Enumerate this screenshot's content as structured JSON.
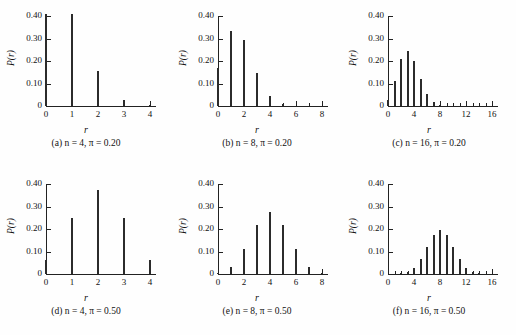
{
  "figure": {
    "ylabel": "P(r)",
    "xlabel": "r",
    "y_ticks": [
      "0",
      "0.10",
      "0.20",
      "0.30",
      "0.40"
    ],
    "y_tick_values": [
      0,
      0.1,
      0.2,
      0.3,
      0.4
    ],
    "ylim": [
      0,
      0.4
    ],
    "background": "#fefefe",
    "bar_color": "#2b2b2b",
    "axis_color": "#222222"
  },
  "chart_data": [
    {
      "type": "bar",
      "panel": "a",
      "caption": "(a) n = 4, π = 0.20",
      "n": 4,
      "pi": 0.2,
      "title": "",
      "xlabel": "r",
      "ylabel": "P(r)",
      "xlim": [
        0,
        4
      ],
      "ylim": [
        0,
        0.4
      ],
      "x_tick_labels": [
        "0",
        "1",
        "2",
        "3",
        "4"
      ],
      "x_tick_values": [
        0,
        1,
        2,
        3,
        4
      ],
      "x_minor_ticks": [],
      "grid": false,
      "legend": "none",
      "categories": [
        0,
        1,
        2,
        3,
        4
      ],
      "values": [
        0.4096,
        0.4096,
        0.1536,
        0.0256,
        0.0016
      ]
    },
    {
      "type": "bar",
      "panel": "b",
      "caption": "(b) n = 8, π = 0.20",
      "n": 8,
      "pi": 0.2,
      "title": "",
      "xlabel": "r",
      "ylabel": "P(r)",
      "xlim": [
        0,
        8
      ],
      "ylim": [
        0,
        0.4
      ],
      "x_tick_labels": [
        "0",
        "2",
        "4",
        "6",
        "8"
      ],
      "x_tick_values": [
        0,
        2,
        4,
        6,
        8
      ],
      "x_minor_ticks": [
        1,
        3,
        5,
        7
      ],
      "grid": false,
      "legend": "none",
      "categories": [
        0,
        1,
        2,
        3,
        4,
        5,
        6,
        7,
        8
      ],
      "values": [
        0.1678,
        0.3355,
        0.2936,
        0.1468,
        0.0459,
        0.0092,
        0.0011,
        0.0001,
        0.0
      ]
    },
    {
      "type": "bar",
      "panel": "c",
      "caption": "(c) n = 16, π = 0.20",
      "n": 16,
      "pi": 0.2,
      "title": "",
      "xlabel": "r",
      "ylabel": "P(r)",
      "xlim": [
        0,
        16
      ],
      "ylim": [
        0,
        0.4
      ],
      "x_tick_labels": [
        "0",
        "4",
        "8",
        "12",
        "16"
      ],
      "x_tick_values": [
        0,
        4,
        8,
        12,
        16
      ],
      "x_minor_ticks": [
        1,
        2,
        3,
        5,
        6,
        7,
        9,
        10,
        11,
        13,
        14,
        15
      ],
      "grid": false,
      "legend": "none",
      "categories": [
        0,
        1,
        2,
        3,
        4,
        5,
        6,
        7,
        8,
        9,
        10,
        11,
        12,
        13,
        14,
        15,
        16
      ],
      "values": [
        0.0281,
        0.1126,
        0.2111,
        0.2463,
        0.2001,
        0.1201,
        0.055,
        0.0197,
        0.0055,
        0.0012,
        0.0002,
        0.0,
        0.0,
        0.0,
        0.0,
        0.0,
        0.0
      ]
    },
    {
      "type": "bar",
      "panel": "d",
      "caption": "(d) n = 4, π = 0.50",
      "n": 4,
      "pi": 0.5,
      "title": "",
      "xlabel": "r",
      "ylabel": "P(r)",
      "xlim": [
        0,
        4
      ],
      "ylim": [
        0,
        0.4
      ],
      "x_tick_labels": [
        "0",
        "1",
        "2",
        "3",
        "4"
      ],
      "x_tick_values": [
        0,
        1,
        2,
        3,
        4
      ],
      "x_minor_ticks": [],
      "grid": false,
      "legend": "none",
      "categories": [
        0,
        1,
        2,
        3,
        4
      ],
      "values": [
        0.0625,
        0.25,
        0.375,
        0.25,
        0.0625
      ]
    },
    {
      "type": "bar",
      "panel": "e",
      "caption": "(e) n = 8, π = 0.50",
      "n": 8,
      "pi": 0.5,
      "title": "",
      "xlabel": "r",
      "ylabel": "P(r)",
      "xlim": [
        0,
        8
      ],
      "ylim": [
        0,
        0.4
      ],
      "x_tick_labels": [
        "0",
        "2",
        "4",
        "6",
        "8"
      ],
      "x_tick_values": [
        0,
        2,
        4,
        6,
        8
      ],
      "x_minor_ticks": [
        1,
        3,
        5,
        7
      ],
      "grid": false,
      "legend": "none",
      "categories": [
        0,
        1,
        2,
        3,
        4,
        5,
        6,
        7,
        8
      ],
      "values": [
        0.0039,
        0.0313,
        0.1094,
        0.2188,
        0.2734,
        0.2188,
        0.1094,
        0.0313,
        0.0039
      ]
    },
    {
      "type": "bar",
      "panel": "f",
      "caption": "(f) n = 16, π = 0.50",
      "n": 16,
      "pi": 0.5,
      "title": "",
      "xlabel": "r",
      "ylabel": "P(r)",
      "xlim": [
        0,
        16
      ],
      "ylim": [
        0,
        0.4
      ],
      "x_tick_labels": [
        "0",
        "4",
        "8",
        "12",
        "16"
      ],
      "x_tick_values": [
        0,
        4,
        8,
        12,
        16
      ],
      "x_minor_ticks": [
        1,
        2,
        3,
        5,
        6,
        7,
        9,
        10,
        11,
        13,
        14,
        15
      ],
      "grid": false,
      "legend": "none",
      "categories": [
        0,
        1,
        2,
        3,
        4,
        5,
        6,
        7,
        8,
        9,
        10,
        11,
        12,
        13,
        14,
        15,
        16
      ],
      "values": [
        0.0,
        0.0002,
        0.0018,
        0.0085,
        0.0278,
        0.0667,
        0.1222,
        0.1746,
        0.1964,
        0.1746,
        0.1222,
        0.0667,
        0.0278,
        0.0085,
        0.0018,
        0.0002,
        0.0
      ]
    }
  ]
}
